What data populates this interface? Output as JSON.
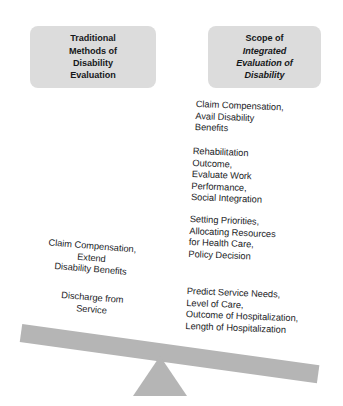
{
  "diagram": {
    "colors": {
      "header_box_fill": "#dcdcdc",
      "beam_fill": "#b5b5b5",
      "fulcrum_fill": "#b5b5b5",
      "text": "#1b1d1f",
      "background": "#ffffff"
    }
  },
  "left_pan": {
    "header": {
      "lines": [
        "Traditional",
        "Methods of",
        "Disability",
        "Evaluation"
      ]
    },
    "items": [
      {
        "lines": [
          "Claim Compensation,",
          "Extend",
          "Disability Benefits"
        ]
      },
      {
        "lines": [
          "Discharge from",
          "Service"
        ]
      }
    ]
  },
  "right_pan": {
    "header": {
      "lines": [
        {
          "text": "Scope of",
          "italic": false
        },
        {
          "text": "Integrated",
          "italic": true
        },
        {
          "text": "Evaluation of",
          "italic": true
        },
        {
          "text": "Disability",
          "italic": true
        }
      ]
    },
    "items": [
      {
        "lines": [
          "Claim Compensation,",
          "Avail Disability",
          "Benefits"
        ]
      },
      {
        "lines": [
          "Rehabilitation",
          "Outcome,",
          "Evaluate Work",
          "Performance,",
          "Social Integration"
        ]
      },
      {
        "lines": [
          "Setting Priorities,",
          "Allocating Resources",
          "for Health Care,",
          "Policy Decision"
        ]
      },
      {
        "lines": [
          "Predict Service Needs,",
          "Level of Care,",
          "Outcome of Hospitalization,",
          "Length of Hospitalization"
        ]
      }
    ]
  }
}
